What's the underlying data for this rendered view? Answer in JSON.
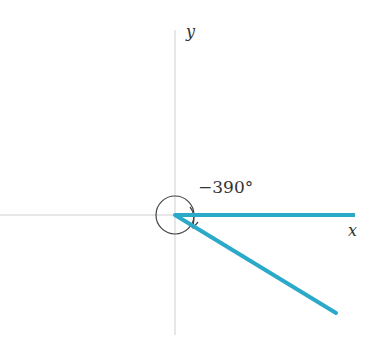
{
  "diagram": {
    "y_axis_label": "y",
    "x_axis_label": "x",
    "angle_label": "−390°",
    "colors": {
      "ray": "#2ba9c9",
      "axis": "#c8c8c8",
      "arc": "#333333"
    }
  }
}
